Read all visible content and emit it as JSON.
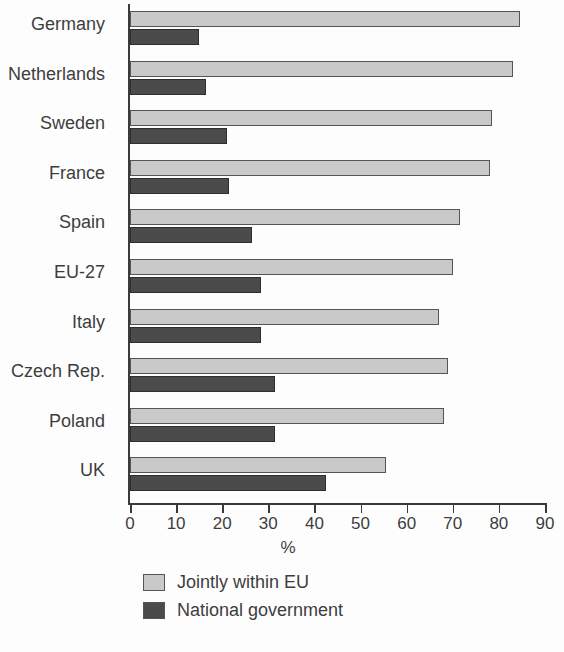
{
  "chart_data": {
    "type": "bar",
    "orientation": "horizontal",
    "title": "",
    "subtitle": "",
    "xlabel": "%",
    "ylabel": "",
    "xlim": [
      0,
      90
    ],
    "ylim": null,
    "grid": false,
    "legend_position": "bottom-left",
    "xticks": [
      0,
      10,
      20,
      30,
      40,
      50,
      60,
      70,
      80,
      90
    ],
    "xtick_labels": [
      "0",
      "10",
      "20",
      "30",
      "40",
      "50",
      "60",
      "70",
      "80",
      "90"
    ],
    "categories": [
      "Germany",
      "Netherlands",
      "Sweden",
      "France",
      "Spain",
      "EU-27",
      "Italy",
      "Czech Rep.",
      "Poland",
      "UK"
    ],
    "series": [
      {
        "name": "Jointly within EU",
        "color": "#c9c9c9",
        "values": [
          84.5,
          83,
          78.5,
          78,
          71.5,
          70,
          67,
          69,
          68,
          55.5
        ]
      },
      {
        "name": "National government",
        "color": "#4b4b4b",
        "values": [
          15,
          16.5,
          21,
          21.5,
          26.5,
          28.5,
          28.5,
          31.5,
          31.5,
          42.5
        ]
      }
    ]
  },
  "legend": {
    "items": [
      {
        "label": "Jointly within EU",
        "color": "#c9c9c9"
      },
      {
        "label": "National government",
        "color": "#4b4b4b"
      }
    ]
  },
  "axis": {
    "x_title": "%"
  }
}
